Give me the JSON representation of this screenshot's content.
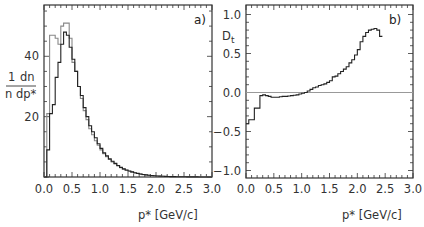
{
  "chart_data": [
    {
      "type": "histogram",
      "panel_label": "a)",
      "xlabel": "p* [GeV/c]",
      "ylabel_numerator": "1  dn",
      "ylabel_denominator": "n dp*",
      "xlim": [
        0.0,
        3.0
      ],
      "ylim": [
        0,
        57
      ],
      "x_ticks": [
        "0.0",
        "0.5",
        "1.0",
        "1.5",
        "2.0",
        "2.5",
        "3.0"
      ],
      "y_ticks": [
        "20",
        "40"
      ],
      "grid": false,
      "bin_width": 0.05,
      "bin_edges_start": 0.0,
      "series": [
        {
          "name": "dark",
          "color": "#222222",
          "values": [
            0,
            9,
            21,
            24,
            33,
            38,
            44,
            48,
            47,
            43,
            39,
            35,
            30,
            27,
            23,
            20,
            17,
            15,
            13,
            11,
            9.5,
            8,
            7,
            6,
            5.2,
            4.5,
            3.8,
            3.2,
            2.7,
            2.3,
            2.0,
            1.7,
            1.4,
            1.2,
            1.0,
            0.85,
            0.7,
            0.6,
            0.5,
            0.42,
            0.35,
            0.3,
            0.25,
            0.2,
            0.17,
            0.14,
            0.12,
            0.1,
            0.08,
            0.07,
            0.06,
            0.05,
            0.04,
            0.03,
            0.03,
            0.02,
            0.02,
            0.01,
            0.01,
            0.0
          ]
        },
        {
          "name": "light",
          "color": "#888888",
          "values": [
            0,
            21,
            47,
            47,
            46,
            44,
            50,
            51,
            51,
            46,
            38,
            35,
            30,
            26,
            22,
            19,
            16,
            14,
            12,
            10.5,
            9,
            7.7,
            6.7,
            5.8,
            5.0,
            4.3,
            3.7,
            3.1,
            2.6,
            2.2,
            1.9,
            1.6,
            1.35,
            1.15,
            0.95,
            0.8,
            0.68,
            0.57,
            0.48,
            0.4,
            0.33,
            0.28,
            0.23,
            0.19,
            0.16,
            0.13,
            0.11,
            0.09,
            0.07,
            0.06,
            0.05,
            0.04,
            0.03,
            0.03,
            0.02,
            0.02,
            0.01,
            0.01,
            0.0,
            0.0
          ]
        }
      ]
    },
    {
      "type": "line",
      "panel_label": "b)",
      "xlabel": "p* [GeV/c]",
      "ylabel": "D_t",
      "xlim": [
        0.0,
        3.0
      ],
      "ylim": [
        -1.1,
        1.1
      ],
      "x_ticks": [
        "0.0",
        "0.5",
        "1.0",
        "1.5",
        "2.0",
        "2.5",
        "3.0"
      ],
      "y_ticks": [
        "1.0",
        "0.5",
        "0.0",
        "−0.5",
        "−1.0"
      ],
      "reference_line_y": 0.0,
      "grid": false,
      "bin_width": 0.05,
      "series": [
        {
          "name": "D_t",
          "color": "#222222",
          "x_start": 0.0,
          "values": [
            -0.4,
            -0.35,
            -0.35,
            -0.2,
            -0.2,
            -0.04,
            -0.03,
            -0.04,
            -0.05,
            -0.06,
            -0.06,
            -0.06,
            -0.055,
            -0.05,
            -0.05,
            -0.045,
            -0.04,
            -0.035,
            -0.03,
            -0.02,
            -0.01,
            0.0,
            0.02,
            0.04,
            0.06,
            0.07,
            0.09,
            0.1,
            0.11,
            0.13,
            0.15,
            0.2,
            0.21,
            0.24,
            0.27,
            0.3,
            0.33,
            0.38,
            0.42,
            0.48,
            0.55,
            0.65,
            0.72,
            0.77,
            0.8,
            0.81,
            0.82,
            0.8,
            0.72
          ]
        }
      ]
    }
  ],
  "labels": {
    "panel_a": "a)",
    "panel_b": "b)",
    "xlabel_left": "p* [GeV/c]",
    "xlabel_right": "p* [GeV/c]",
    "ylabel_left_num": "1",
    "ylabel_left_num2": "dn",
    "ylabel_left_den": "n",
    "ylabel_left_den2": "dp*",
    "ylabel_right": "D",
    "ylabel_right_sub": "t"
  }
}
